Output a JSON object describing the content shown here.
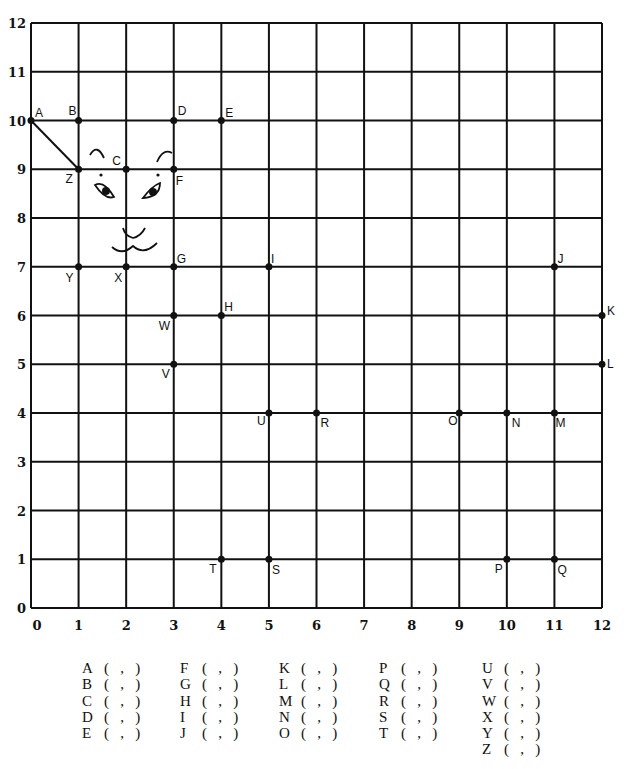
{
  "chart_data": {
    "type": "scatter",
    "title": "",
    "xlabel": "",
    "ylabel": "",
    "xlim": [
      0,
      12
    ],
    "ylim": [
      0,
      12
    ],
    "grid": true,
    "x_ticks": [
      "0",
      "1",
      "2",
      "3",
      "4",
      "5",
      "6",
      "7",
      "8",
      "9",
      "10",
      "11",
      "12"
    ],
    "y_ticks": [
      "0",
      "1",
      "2",
      "3",
      "4",
      "5",
      "6",
      "7",
      "8",
      "9",
      "10",
      "11",
      "12"
    ],
    "points": [
      {
        "label": "A",
        "x": 0,
        "y": 10
      },
      {
        "label": "B",
        "x": 1,
        "y": 10
      },
      {
        "label": "C",
        "x": 2,
        "y": 9
      },
      {
        "label": "D",
        "x": 3,
        "y": 10
      },
      {
        "label": "E",
        "x": 4,
        "y": 10
      },
      {
        "label": "F",
        "x": 3,
        "y": 9
      },
      {
        "label": "G",
        "x": 3,
        "y": 7
      },
      {
        "label": "H",
        "x": 4,
        "y": 6
      },
      {
        "label": "I",
        "x": 5,
        "y": 7
      },
      {
        "label": "J",
        "x": 11,
        "y": 7
      },
      {
        "label": "K",
        "x": 12,
        "y": 6
      },
      {
        "label": "L",
        "x": 12,
        "y": 5
      },
      {
        "label": "M",
        "x": 11,
        "y": 4
      },
      {
        "label": "N",
        "x": 10,
        "y": 4
      },
      {
        "label": "O",
        "x": 9,
        "y": 4
      },
      {
        "label": "P",
        "x": 10,
        "y": 1
      },
      {
        "label": "Q",
        "x": 11,
        "y": 1
      },
      {
        "label": "R",
        "x": 6,
        "y": 4
      },
      {
        "label": "S",
        "x": 5,
        "y": 1
      },
      {
        "label": "T",
        "x": 4,
        "y": 1
      },
      {
        "label": "U",
        "x": 5,
        "y": 4
      },
      {
        "label": "V",
        "x": 3,
        "y": 5
      },
      {
        "label": "W",
        "x": 3,
        "y": 6
      },
      {
        "label": "X",
        "x": 2,
        "y": 7
      },
      {
        "label": "Y",
        "x": 1,
        "y": 7
      },
      {
        "label": "Z",
        "x": 1,
        "y": 9
      }
    ],
    "segments": [
      {
        "from": "A",
        "to": "Z"
      }
    ],
    "annotations": [
      "cat face drawing: eyebrows, eyes, nose, mouth near C/X"
    ]
  },
  "worksheet": {
    "columns": [
      [
        "A",
        "B",
        "C",
        "D",
        "E"
      ],
      [
        "F",
        "G",
        "H",
        "I",
        "J"
      ],
      [
        "K",
        "L",
        "M",
        "N",
        "O"
      ],
      [
        "P",
        "Q",
        "R",
        "S",
        "T"
      ],
      [
        "U",
        "V",
        "W",
        "X",
        "Y",
        "Z"
      ]
    ],
    "blank_template": "(   ,   )"
  }
}
